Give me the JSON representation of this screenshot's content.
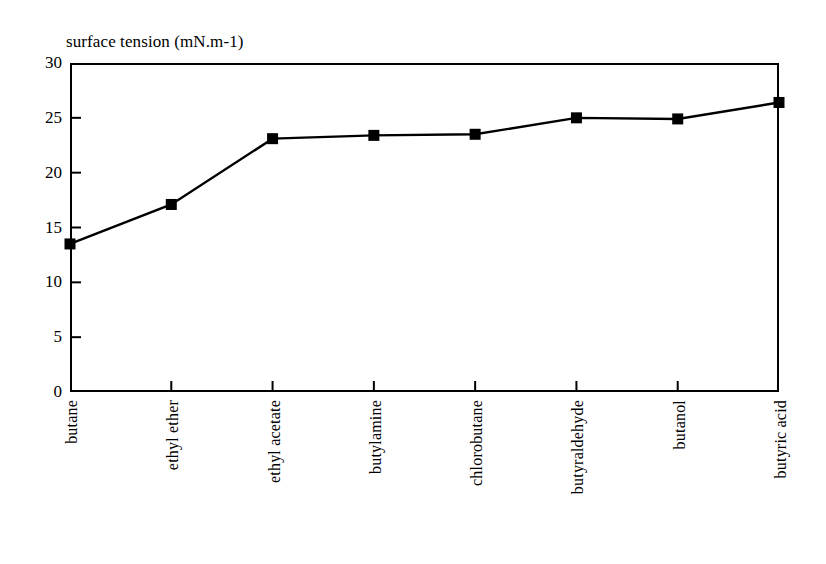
{
  "chart_data": {
    "type": "line",
    "title": "surface tension (mN.m-1)",
    "xlabel": "",
    "ylabel": "",
    "ylim": [
      0,
      30
    ],
    "yticks": [
      0,
      5,
      10,
      15,
      20,
      25,
      30
    ],
    "ytick_labels": [
      "0",
      "5",
      "10",
      "15",
      "20",
      "25",
      "30"
    ],
    "grid": false,
    "legend": "none",
    "marker": "square",
    "line_color": "#000000",
    "marker_color": "#000000",
    "categories": [
      "butane",
      "ethyl ether",
      "ethyl acetate",
      "butylamine",
      "chlorobutane",
      "butyraldehyde",
      "butanol",
      "butyric acid"
    ],
    "values": [
      13.5,
      17.1,
      23.1,
      23.4,
      23.5,
      25.0,
      24.9,
      26.4
    ]
  }
}
